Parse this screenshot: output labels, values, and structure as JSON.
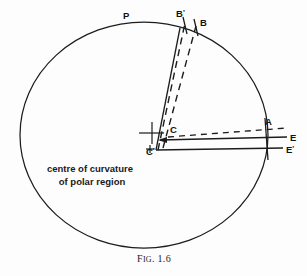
{
  "figure": {
    "caption_prefix": "F",
    "caption_smallcaps": "IG",
    "caption_number": ". 1.6",
    "caption_full": "FIG. 1.6"
  },
  "annotations": {
    "line1": "centre of curvature",
    "line2": "of  polar region"
  },
  "labels": {
    "p": "P",
    "b_prime_base": "B",
    "b_prime_mark": "'",
    "b": "B",
    "a": "A",
    "c": "C",
    "c_prime_base": "C",
    "c_prime_mark": "'",
    "c_prime_plus": "+",
    "e": "E",
    "e_prime_base": "E",
    "e_prime_mark": "'"
  },
  "colors": {
    "ink": "#1c1c1c",
    "background": "#fdfdfd",
    "text": "#111111"
  },
  "geometry": {
    "circle": {
      "cx": 144,
      "cy": 135,
      "rx": 124,
      "ry": 113
    },
    "note": "large circle representing mirror blank outline"
  }
}
